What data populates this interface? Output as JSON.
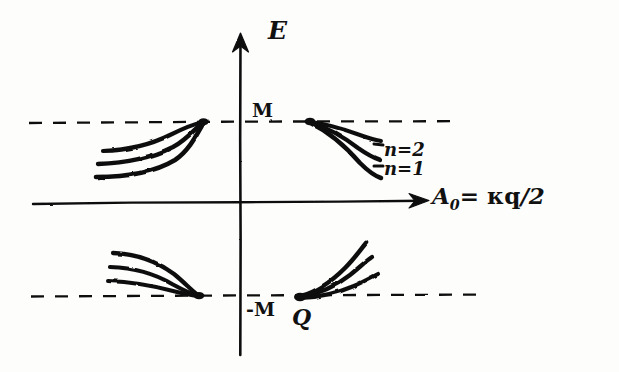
{
  "figure": {
    "kind": "hand-drawn-sketch",
    "background_color": "#fdfdfc",
    "ink_color": "#111111",
    "axes": {
      "y_axis": {
        "label": "E",
        "name": "energy-axis",
        "arrow": "up"
      },
      "x_axis": {
        "label_prefix": "A",
        "label_subscript": "0",
        "label_equals": "=",
        "label_expression": "κq",
        "label_denominator": "/2",
        "label_full": "A₀ = κq/2",
        "name": "a-zero-axis",
        "arrow": "right"
      }
    },
    "levels": [
      {
        "name": "upper-mass-level",
        "label": "M",
        "value": "M",
        "y": 122
      },
      {
        "name": "lower-mass-level",
        "label": "-M",
        "value": "-M",
        "y": 295
      }
    ],
    "points": [
      {
        "name": "q-point",
        "label": "Q",
        "x": 300,
        "y": 297
      }
    ],
    "branch_labels": [
      {
        "name": "branch-n2",
        "label": "n=2"
      },
      {
        "name": "branch-n1",
        "label": "n=1"
      }
    ],
    "curve_clusters": [
      {
        "name": "upper-left-branches",
        "count": 3,
        "converges_to": "M"
      },
      {
        "name": "upper-right-branches",
        "count": 3,
        "converges_to": "M"
      },
      {
        "name": "lower-left-branches",
        "count": 3,
        "converges_to": "-M"
      },
      {
        "name": "lower-right-branches",
        "count": 3,
        "converges_to": "-M"
      }
    ]
  }
}
